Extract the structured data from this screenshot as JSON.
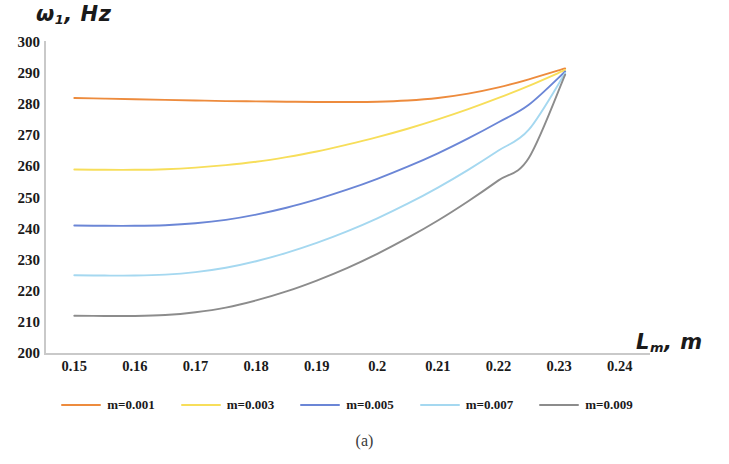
{
  "caption": "(a)",
  "chart_data": {
    "type": "line",
    "title": "",
    "subtitle": "",
    "xlabel": "L_m, m",
    "xlabel_base": "L",
    "xlabel_sub": "m",
    "xlabel_tail": ", m",
    "ylabel": "ω_1, Hz",
    "ylabel_base": "ω",
    "ylabel_sub": "1",
    "ylabel_tail": ", Hz",
    "xlim": [
      0.145,
      0.245
    ],
    "ylim": [
      200,
      300
    ],
    "xticks": [
      0.15,
      0.16,
      0.17,
      0.18,
      0.19,
      0.2,
      0.21,
      0.22,
      0.23,
      0.24
    ],
    "xtick_labels": [
      "0.15",
      "0.16",
      "0.17",
      "0.18",
      "0.19",
      "0.2",
      "0.21",
      "0.22",
      "0.23",
      "0.24"
    ],
    "yticks": [
      200,
      210,
      220,
      230,
      240,
      250,
      260,
      270,
      280,
      290,
      300
    ],
    "ytick_labels": [
      "200",
      "210",
      "220",
      "230",
      "240",
      "250",
      "260",
      "270",
      "280",
      "290",
      "300"
    ],
    "grid": false,
    "legend_position": "bottom",
    "x": [
      0.15,
      0.155,
      0.16,
      0.165,
      0.17,
      0.175,
      0.18,
      0.185,
      0.19,
      0.195,
      0.2,
      0.205,
      0.21,
      0.215,
      0.22,
      0.225,
      0.231
    ],
    "series": [
      {
        "name": "m=0.001",
        "color": "#ED8B3D",
        "values": [
          282.0,
          281.8,
          281.6,
          281.4,
          281.2,
          281.0,
          280.9,
          280.8,
          280.7,
          280.7,
          280.8,
          281.2,
          282.0,
          283.4,
          285.4,
          288.0,
          291.5
        ]
      },
      {
        "name": "m=0.003",
        "color": "#F7DE5A",
        "values": [
          259.0,
          258.9,
          258.9,
          259.1,
          259.6,
          260.4,
          261.5,
          263.0,
          264.8,
          267.0,
          269.4,
          272.1,
          275.1,
          278.4,
          282.0,
          285.9,
          291.0
        ]
      },
      {
        "name": "m=0.005",
        "color": "#6B86D6",
        "values": [
          241.0,
          240.9,
          240.9,
          241.1,
          241.7,
          242.8,
          244.5,
          246.7,
          249.4,
          252.5,
          256.0,
          259.9,
          264.2,
          269.0,
          274.2,
          279.8,
          290.5
        ]
      },
      {
        "name": "m=0.007",
        "color": "#A5D8F0",
        "values": [
          225.0,
          224.9,
          224.9,
          225.2,
          226.0,
          227.4,
          229.5,
          232.2,
          235.4,
          239.1,
          243.3,
          248.0,
          253.2,
          258.9,
          265.1,
          271.8,
          290.0
        ]
      },
      {
        "name": "m=0.009",
        "color": "#8C8C8C",
        "values": [
          212.0,
          211.9,
          211.9,
          212.2,
          213.1,
          214.6,
          216.9,
          219.8,
          223.3,
          227.3,
          231.9,
          237.0,
          242.6,
          248.8,
          255.5,
          262.7,
          289.5
        ]
      }
    ]
  },
  "legend": {
    "items": [
      {
        "label": "m=0.001",
        "color": "#ED8B3D"
      },
      {
        "label": "m=0.003",
        "color": "#F7DE5A"
      },
      {
        "label": "m=0.005",
        "color": "#6B86D6"
      },
      {
        "label": "m=0.007",
        "color": "#A5D8F0"
      },
      {
        "label": "m=0.009",
        "color": "#8C8C8C"
      }
    ]
  }
}
